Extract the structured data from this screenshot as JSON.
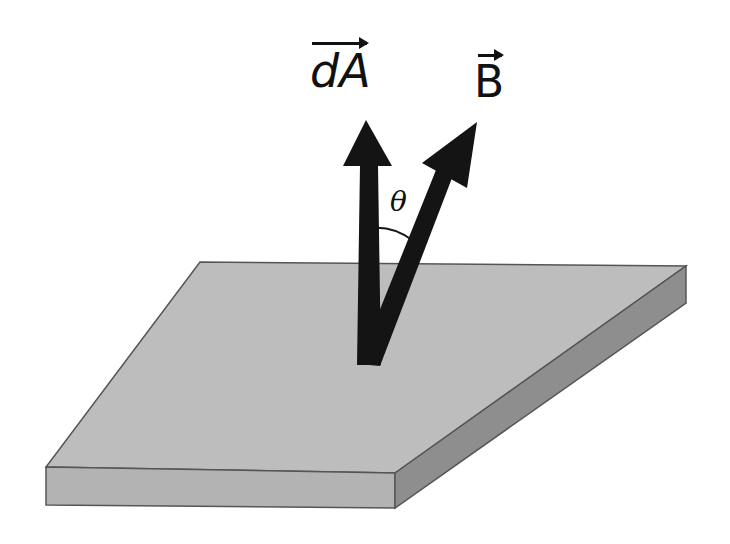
{
  "diagram": {
    "title": "",
    "labels": {
      "area_vector": "dA",
      "field_vector": "B",
      "angle": "θ"
    },
    "colors": {
      "plate_top": "#bdbdbd",
      "plate_front": "#b3b3b3",
      "plate_side": "#8e8e8e",
      "arrow": "#141414",
      "edge": "#555555"
    }
  }
}
